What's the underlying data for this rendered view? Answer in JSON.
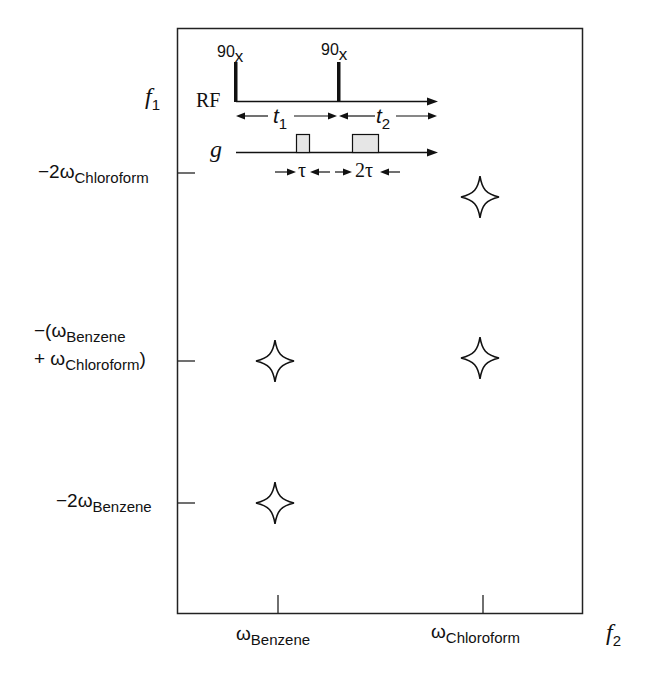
{
  "figure": {
    "axes": {
      "f1_label": "f",
      "f1_sub": "1",
      "f2_label": "f",
      "f2_sub": "2"
    },
    "y_ticks": [
      {
        "prefix": "−2ω",
        "sub": "Chloroform",
        "suffix": ""
      },
      {
        "line1_prefix": "−(ω",
        "line1_sub": "Benzene",
        "line2_prefix": "+ ω",
        "line2_sub": "Chloroform",
        "line2_suffix": ")"
      },
      {
        "prefix": "−2ω",
        "sub": "Benzene",
        "suffix": ""
      }
    ],
    "x_ticks": [
      {
        "prefix": "ω",
        "sub": "Benzene"
      },
      {
        "prefix": "ω",
        "sub": "Chloroform"
      }
    ],
    "peaks": [
      {
        "x": "ωChloroform",
        "y": "−2ωChloroform",
        "marker": "four-point-star"
      },
      {
        "x": "ωBenzene",
        "y": "−(ωBenzene + ωChloroform)",
        "marker": "four-point-star"
      },
      {
        "x": "ωChloroform",
        "y": "−(ωBenzene + ωChloroform)",
        "marker": "four-point-star"
      },
      {
        "x": "ωBenzene",
        "y": "−2ωBenzene",
        "marker": "four-point-star"
      }
    ],
    "pulse_sequence": {
      "rf_label": "RF",
      "g_label": "g",
      "pulse1": {
        "angle": "90",
        "phase": "x"
      },
      "pulse2": {
        "angle": "90",
        "phase": "x"
      },
      "t1_label": "t",
      "t1_sub": "1",
      "t2_label": "t",
      "t2_sub": "2",
      "tau_label": "τ",
      "two_tau_label": "2τ"
    },
    "colors": {
      "line": "#111111",
      "gradient_fill": "#e6e6e6",
      "background": "#ffffff"
    }
  }
}
